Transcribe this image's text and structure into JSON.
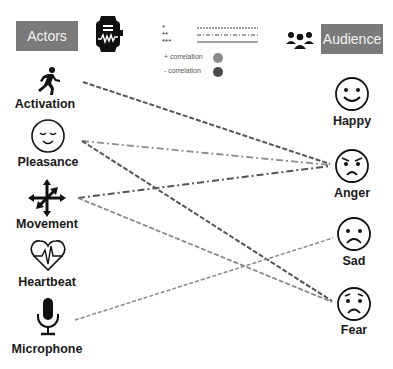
{
  "headers": {
    "actors": "Actors",
    "audience": "Audience"
  },
  "icons": {
    "smartwatch": "smartwatch-icon",
    "group": "people-group-icon"
  },
  "legend": {
    "significance": [
      {
        "stars": "*",
        "style": "dashed"
      },
      {
        "stars": "**",
        "style": "dash-dot"
      },
      {
        "stars": "***",
        "style": "solid"
      }
    ],
    "correlation": [
      {
        "label": "+ correlation",
        "color": "#8a8a8a"
      },
      {
        "label": "- correlation",
        "color": "#4a4a4a"
      }
    ]
  },
  "actors": [
    {
      "id": "activation",
      "label": "Activation",
      "icon": "running-person-icon"
    },
    {
      "id": "pleasance",
      "label": "Pleasance",
      "icon": "content-face-icon"
    },
    {
      "id": "movement",
      "label": "Movement",
      "icon": "move-arrows-icon"
    },
    {
      "id": "heartbeat",
      "label": "Heartbeat",
      "icon": "heartbeat-icon"
    },
    {
      "id": "microphone",
      "label": "Microphone",
      "icon": "microphone-icon"
    }
  ],
  "audience": [
    {
      "id": "happy",
      "label": "Happy",
      "icon": "happy-face-icon"
    },
    {
      "id": "anger",
      "label": "Anger",
      "icon": "angry-face-icon"
    },
    {
      "id": "sad",
      "label": "Sad",
      "icon": "sad-face-icon"
    },
    {
      "id": "fear",
      "label": "Fear",
      "icon": "fearful-face-icon"
    }
  ],
  "connections": [
    {
      "from": "activation",
      "to": "anger",
      "significance": "*",
      "correlation": "-",
      "color": "#555555"
    },
    {
      "from": "pleasance",
      "to": "anger",
      "significance": "**",
      "correlation": "+",
      "color": "#8a8a8a"
    },
    {
      "from": "pleasance",
      "to": "fear",
      "significance": "*",
      "correlation": "-",
      "color": "#555555"
    },
    {
      "from": "movement",
      "to": "anger",
      "significance": "**",
      "correlation": "-",
      "color": "#555555"
    },
    {
      "from": "movement",
      "to": "fear",
      "significance": "*",
      "correlation": "+",
      "color": "#8a8a8a"
    },
    {
      "from": "microphone",
      "to": "sad",
      "significance": "*",
      "correlation": "+",
      "color": "#8a8a8a"
    }
  ]
}
